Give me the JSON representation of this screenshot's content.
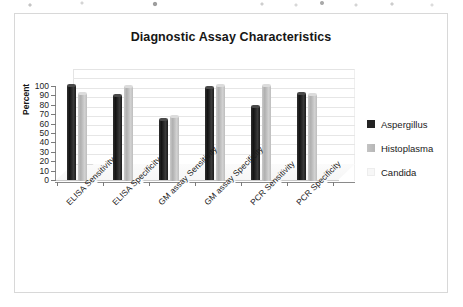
{
  "chart": {
    "title": "Diagnostic Assay Characteristics",
    "y_axis_title": "Percent"
  },
  "chart_data": {
    "type": "bar",
    "title": "Diagnostic Assay Characteristics",
    "xlabel": "",
    "ylabel": "Percent",
    "ylim": [
      0,
      100
    ],
    "ytick_step": 10,
    "yticks": [
      "100",
      "90",
      "80",
      "70",
      "60",
      "50",
      "40",
      "30",
      "20",
      "10",
      "0"
    ],
    "grid": true,
    "legend_position": "right",
    "style": "3d-clustered-column",
    "categories": [
      "ELISA Sensitivity",
      "ELISA Specificity",
      "GM assay Sensitivity",
      "GM assay Specificity",
      "PCR Sensitivity",
      "PCR Specificity"
    ],
    "series": [
      {
        "name": "Aspergillus",
        "color": "#232323",
        "values": [
          100,
          89,
          64,
          98,
          78,
          91
        ]
      },
      {
        "name": "Histoplasma",
        "color": "#bcbcbc",
        "values": [
          93,
          100,
          68,
          101,
          101,
          92
        ]
      },
      {
        "name": "Candida",
        "color": "#f7f7f7",
        "values": [
          0,
          0,
          0,
          0,
          0,
          0
        ]
      }
    ]
  }
}
